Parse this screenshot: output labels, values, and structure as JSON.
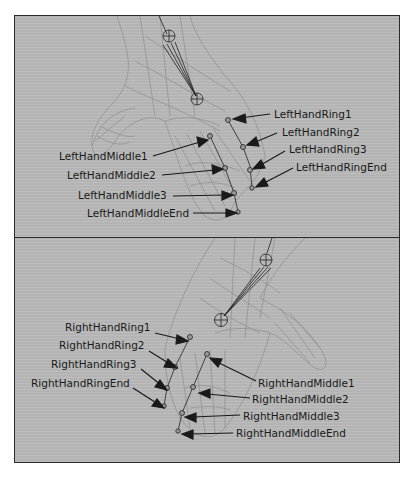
{
  "figure": {
    "panels": [
      {
        "id": "top",
        "side": "left",
        "labels": [
          {
            "text": "LeftHandRing1",
            "x": 259,
            "y": 98
          },
          {
            "text": "LeftHandRing2",
            "x": 267,
            "y": 116
          },
          {
            "text": "LeftHandRing3",
            "x": 274,
            "y": 133
          },
          {
            "text": "LeftHandRingEnd",
            "x": 281,
            "y": 151
          },
          {
            "text": "LeftHandMiddle1",
            "x": 44,
            "y": 140
          },
          {
            "text": "LeftHandMiddle2",
            "x": 52,
            "y": 159
          },
          {
            "text": "LeftHandMiddle3",
            "x": 63,
            "y": 179
          },
          {
            "text": "LeftHandMiddleEnd",
            "x": 72,
            "y": 197
          }
        ]
      },
      {
        "id": "bottom",
        "side": "right",
        "labels": [
          {
            "text": "RightHandRing1",
            "x": 50,
            "y": 89
          },
          {
            "text": "RightHandRing2",
            "x": 44,
            "y": 107
          },
          {
            "text": "RightHandRing3",
            "x": 36,
            "y": 126
          },
          {
            "text": "RightHandRingEnd",
            "x": 16,
            "y": 145
          },
          {
            "text": "RightHandMiddle1",
            "x": 243,
            "y": 139
          },
          {
            "text": "RightHandMiddle2",
            "x": 237,
            "y": 155
          },
          {
            "text": "RightHandMiddle3",
            "x": 228,
            "y": 172
          },
          {
            "text": "RightHandMiddleEnd",
            "x": 221,
            "y": 189
          }
        ]
      }
    ],
    "colors": {
      "panel_bg": "#b9b9b9",
      "border": "#2a2a2a",
      "mesh": "#8a8a8a",
      "bone": "#222222",
      "text": "#1a1a1a"
    }
  }
}
